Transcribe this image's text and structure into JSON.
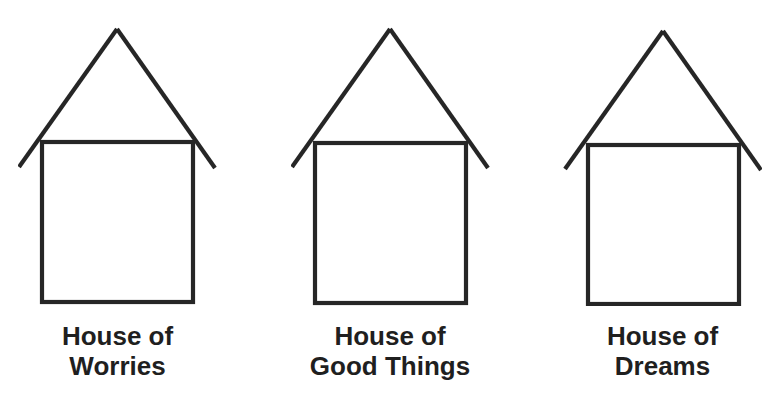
{
  "figure": {
    "houses": [
      {
        "id": "worries",
        "label_line1": "House of",
        "label_line2": "Worries"
      },
      {
        "id": "good-things",
        "label_line1": "House of",
        "label_line2": "Good Things"
      },
      {
        "id": "dreams",
        "label_line1": "House of",
        "label_line2": "Dreams"
      }
    ],
    "colors": {
      "line": "#262626",
      "text": "#1f1f1f",
      "background": "#ffffff"
    }
  }
}
